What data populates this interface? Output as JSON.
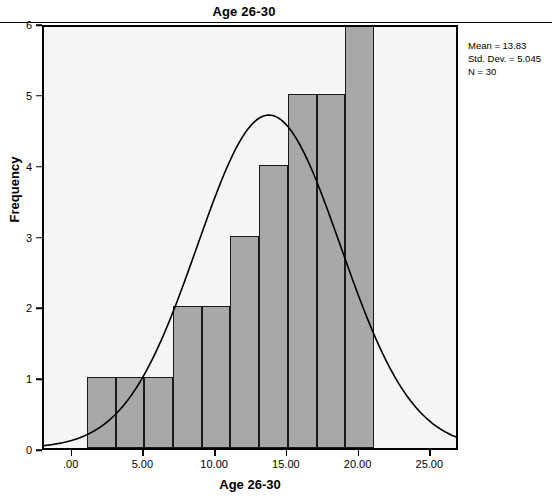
{
  "chart_data": {
    "type": "bar",
    "title": "Age 26-30",
    "xlabel": "Age 26-30",
    "ylabel": "Frequency",
    "bin_width": 2,
    "bin_starts": [
      1,
      3,
      5,
      7,
      9,
      11,
      13,
      15,
      17,
      19
    ],
    "categories": [
      "1-3",
      "3-5",
      "5-7",
      "7-9",
      "9-11",
      "11-13",
      "13-15",
      "15-17",
      "17-19",
      "19-21"
    ],
    "values": [
      1,
      1,
      1,
      2,
      2,
      3,
      4,
      5,
      5,
      6
    ],
    "xlim": [
      -2,
      27
    ],
    "ylim": [
      0,
      6
    ],
    "x_ticks": [
      0,
      5,
      10,
      15,
      20,
      25
    ],
    "x_tick_labels": [
      ".00",
      "5.00",
      "10.00",
      "15.00",
      "20.00",
      "25.00"
    ],
    "y_ticks": [
      0,
      1,
      2,
      3,
      4,
      5,
      6
    ],
    "y_tick_labels": [
      "0",
      "1",
      "2",
      "3",
      "4",
      "5",
      "6"
    ],
    "grid": false,
    "legend": "none",
    "overlay": {
      "type": "normal-curve",
      "mean": 13.83,
      "std_dev": 5.045,
      "n": 30
    },
    "bar_color": "#a8a8a8",
    "bar_border_color": "#1a1a1a",
    "curve_color": "#000000",
    "plot_background": "#f5f5f5"
  },
  "annotation": {
    "mean_label": "Mean = 13.83",
    "std_dev_label": "Std. Dev. = 5.045",
    "n_label": "N = 30"
  }
}
